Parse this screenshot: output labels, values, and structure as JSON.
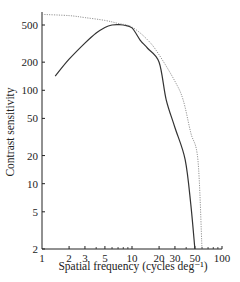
{
  "chart_data": {
    "type": "line",
    "title": "",
    "xlabel": "Spatial frequency (cycles deg⁻¹)",
    "ylabel": "Contrast sensitivity",
    "xscale": "log",
    "yscale": "log",
    "xlim": [
      1,
      100
    ],
    "ylim": [
      2,
      700
    ],
    "grid": false,
    "legend": null,
    "x_ticks": [
      1,
      2,
      3,
      5,
      10,
      20,
      30,
      50,
      100
    ],
    "x_tick_labels": [
      "1",
      "2",
      "3",
      "5",
      "10",
      "20",
      "30",
      "50",
      "100"
    ],
    "x_minor_ticks": [
      4,
      6,
      7,
      8,
      9,
      40,
      60,
      70,
      80,
      90
    ],
    "y_ticks": [
      2,
      5,
      10,
      20,
      50,
      100,
      200,
      500
    ],
    "y_tick_labels": [
      "2",
      "5",
      "10",
      "20",
      "50",
      "100",
      "200",
      "500"
    ],
    "series": [
      {
        "name": "measured",
        "style": "solid",
        "color": "#333333",
        "x": [
          1.4,
          2,
          3,
          4,
          5,
          6,
          7,
          8,
          10,
          12.3,
          15,
          20,
          24,
          30,
          39,
          45,
          50
        ],
        "y": [
          142,
          215,
          320,
          410,
          470,
          500,
          505,
          500,
          465,
          345,
          280,
          200,
          79,
          40,
          18,
          6,
          2
        ]
      },
      {
        "name": "optical limit",
        "style": "dotted",
        "color": "#888888",
        "x": [
          1,
          2,
          3,
          5,
          7,
          10,
          15,
          20,
          30,
          37,
          45,
          54,
          60
        ],
        "y": [
          650,
          630,
          600,
          560,
          520,
          475,
          345,
          240,
          125,
          79,
          35,
          18,
          2
        ]
      }
    ]
  }
}
